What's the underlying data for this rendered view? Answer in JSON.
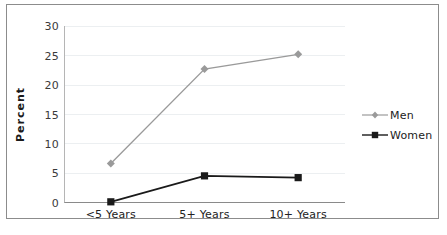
{
  "chart_data": {
    "type": "line",
    "title": "",
    "subtitle": "",
    "xlabel": "",
    "ylabel": "Percent",
    "categories": [
      "<5 Years",
      "5+ Years",
      "10+ Years"
    ],
    "series": [
      {
        "name": "Men",
        "values": [
          6.7,
          22.7,
          25.2
        ],
        "color": "#9a9a9a",
        "marker": "diamond"
      },
      {
        "name": "Women",
        "values": [
          0.2,
          4.6,
          4.3
        ],
        "color": "#1a1a1a",
        "marker": "square"
      }
    ],
    "ylim": [
      0,
      30
    ],
    "yticks": [
      0,
      5,
      10,
      15,
      20,
      25,
      30
    ],
    "ytick_labels": [
      "0",
      "5",
      "10",
      "15",
      "20",
      "25",
      "30"
    ],
    "grid": "horizontal",
    "legend_position": "right",
    "gridline_color": "#eceff1",
    "axis_color": "#8a8a8a",
    "frame_color": "#8c8c8c",
    "background": "#ffffff"
  },
  "legend": {
    "entries": [
      {
        "label": "Men"
      },
      {
        "label": "Women"
      }
    ]
  },
  "page": {
    "clipped_text_below": ""
  }
}
